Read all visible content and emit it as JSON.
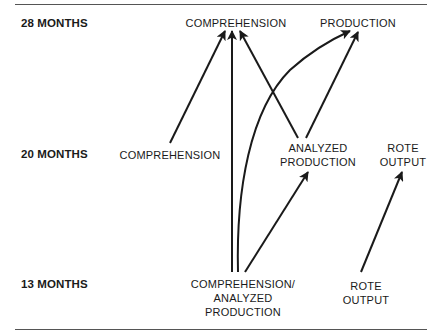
{
  "ages": {
    "m28": "28 MONTHS",
    "m20": "20 MONTHS",
    "m13": "13 MONTHS"
  },
  "nodes": {
    "m28_comprehension": "COMPREHENSION",
    "m28_production": "PRODUCTION",
    "m20_comprehension": "COMPREHENSION",
    "m20_analyzed_production": [
      "ANALYZED",
      "PRODUCTION"
    ],
    "m20_rote_output": [
      "ROTE",
      "OUTPUT"
    ],
    "m13_comprehension_analyzed_production": [
      "COMPREHENSION/",
      "ANALYZED",
      "PRODUCTION"
    ],
    "m13_rote_output": [
      "ROTE",
      "OUTPUT"
    ]
  },
  "edges": [
    {
      "from": "m20_comprehension",
      "to": "m28_comprehension"
    },
    {
      "from": "m13_comprehension_analyzed_production",
      "to": "m28_comprehension"
    },
    {
      "from": "m20_analyzed_production",
      "to": "m28_comprehension"
    },
    {
      "from": "m13_comprehension_analyzed_production",
      "to": "m28_production"
    },
    {
      "from": "m20_analyzed_production",
      "to": "m28_production"
    },
    {
      "from": "m13_comprehension_analyzed_production",
      "to": "m20_analyzed_production"
    },
    {
      "from": "m13_rote_output",
      "to": "m20_rote_output"
    }
  ],
  "colors": {
    "line": "#1a1a1a",
    "rule": "#555555"
  }
}
